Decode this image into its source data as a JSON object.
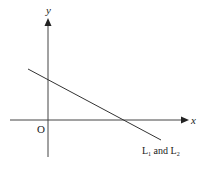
{
  "diagram": {
    "axes": {
      "x_label": "x",
      "y_label": "y",
      "origin_label": "O"
    },
    "line": {
      "label_main": "L",
      "sub1": "1",
      "conj": " and L",
      "sub2": "2",
      "description": "Coincident lines L1 and L2 with negative slope, positive y-intercept and positive x-intercept"
    },
    "colors": {
      "stroke": "#333333",
      "text": "#1a1a1a"
    }
  }
}
